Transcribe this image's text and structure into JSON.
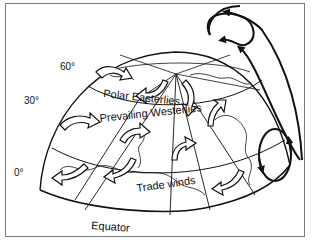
{
  "diagram": {
    "type": "global-wind-circulation",
    "labels": {
      "lat60": "60°",
      "lat30": "30°",
      "lat0": "0°",
      "polar_easterlies": "Polar Easterlies",
      "prevailing_westerlies": "Prevailing Westerlies",
      "trade_winds": "Trade winds",
      "equator": "Equator"
    },
    "colors": {
      "line": "#111111",
      "frame": "#7a7a7a",
      "background": "#ffffff",
      "arrow_fill": "#ffffff"
    }
  }
}
